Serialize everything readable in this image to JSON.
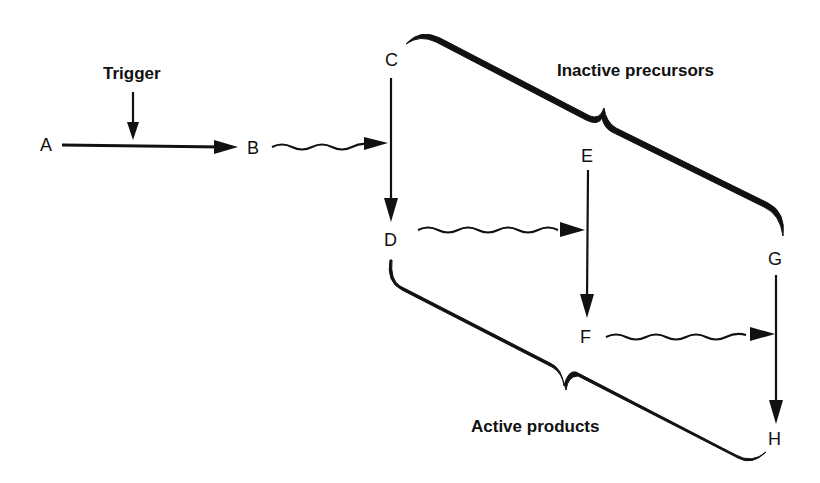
{
  "diagram": {
    "annotations": {
      "trigger": "Trigger",
      "inactive": "Inactive precursors",
      "active": "Active products"
    },
    "nodes": [
      {
        "id": "A",
        "label": "A"
      },
      {
        "id": "B",
        "label": "B"
      },
      {
        "id": "C",
        "label": "C"
      },
      {
        "id": "D",
        "label": "D"
      },
      {
        "id": "E",
        "label": "E"
      },
      {
        "id": "F",
        "label": "F"
      },
      {
        "id": "G",
        "label": "G"
      },
      {
        "id": "H",
        "label": "H"
      }
    ],
    "edges": [
      {
        "from": "Trigger",
        "to": "A→B",
        "style": "straight"
      },
      {
        "from": "A",
        "to": "B",
        "style": "straight"
      },
      {
        "from": "B",
        "to": "C→D",
        "style": "wavy"
      },
      {
        "from": "C",
        "to": "D",
        "style": "straight"
      },
      {
        "from": "D",
        "to": "E→F",
        "style": "wavy"
      },
      {
        "from": "E",
        "to": "F",
        "style": "straight"
      },
      {
        "from": "F",
        "to": "G→H",
        "style": "wavy"
      },
      {
        "from": "G",
        "to": "H",
        "style": "straight"
      }
    ],
    "groups": [
      {
        "label": "Inactive precursors",
        "members": [
          "C",
          "E",
          "G"
        ]
      },
      {
        "label": "Active products",
        "members": [
          "D",
          "F",
          "H"
        ]
      }
    ]
  }
}
